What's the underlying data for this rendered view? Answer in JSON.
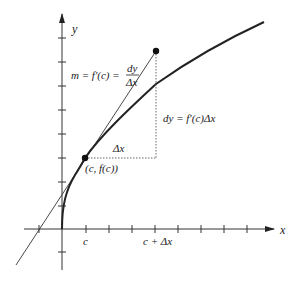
{
  "figure": {
    "type": "differential-tangent-line-diagram",
    "axes": {
      "x_label": "x",
      "y_label": "y",
      "x_ticks": 8,
      "y_ticks_above": 9,
      "y_ticks_below": 1
    },
    "labels": {
      "slope_left": "m = f′(c) = ",
      "slope_frac_num": "dy",
      "slope_frac_den": "Δx",
      "dy_label": "dy = f′(c)Δx",
      "delta_x_label": "Δx",
      "point_label": "(c, f(c))",
      "tick_c": "c",
      "tick_c_plus_dx": "c + Δx"
    },
    "points": [
      {
        "name": "point-of-tangency",
        "label": "(c, f(c))"
      },
      {
        "name": "tangent-endpoint",
        "label": ""
      }
    ],
    "colors": {
      "ink": "#222222",
      "background": "#ffffff"
    }
  }
}
